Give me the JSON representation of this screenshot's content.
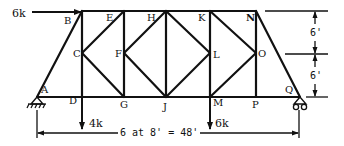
{
  "diagram": {
    "type": "truss",
    "nodes": {
      "A": "A",
      "B": "B",
      "C": "C",
      "D": "D",
      "E": "E",
      "F": "F",
      "G": "G",
      "H": "H",
      "J": "J",
      "K": "K",
      "L": "L",
      "M": "M",
      "N": "N",
      "O": "O",
      "P": "P",
      "Q": "Q"
    },
    "loads": {
      "horizontal": "6k",
      "left_vertical": "4k",
      "right_vertical": "6k"
    },
    "dimensions": {
      "span": "6 at 8' = 48'",
      "upper_height": "6'",
      "lower_height": "6'"
    }
  }
}
